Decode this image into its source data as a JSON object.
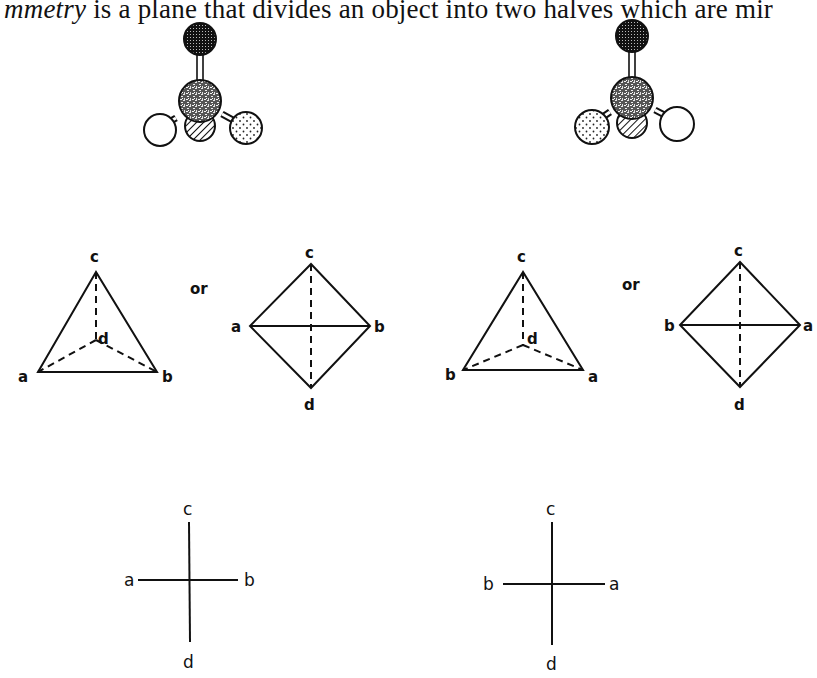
{
  "caption": {
    "italic": "mmetry",
    "rest": " is a plane that divides an object into two halves which are mir"
  },
  "molecules": [
    {
      "name": "left-molecule",
      "bottom_left": "white",
      "bottom_center": "hatched",
      "bottom_right": "dotted",
      "top": "dark-grid",
      "center": "speckled"
    },
    {
      "name": "right-molecule",
      "bottom_left": "dotted",
      "bottom_center": "hatched",
      "bottom_right": "white",
      "top": "dark-grid",
      "center": "speckled"
    }
  ],
  "tetrahedra": {
    "left": {
      "top": "c",
      "center": "d",
      "left": "a",
      "right": "b"
    },
    "right": {
      "top": "c",
      "center": "d",
      "left": "b",
      "right": "a"
    }
  },
  "or_label": "or",
  "diamonds": {
    "left": {
      "top": "c",
      "bottom": "d",
      "left": "a",
      "right": "b"
    },
    "right": {
      "top": "c",
      "bottom": "d",
      "left": "b",
      "right": "a"
    }
  },
  "crosses": {
    "left": {
      "top": "c",
      "bottom": "d",
      "left": "a",
      "right": "b"
    },
    "right": {
      "top": "c",
      "bottom": "d",
      "left": "b",
      "right": "a"
    }
  }
}
